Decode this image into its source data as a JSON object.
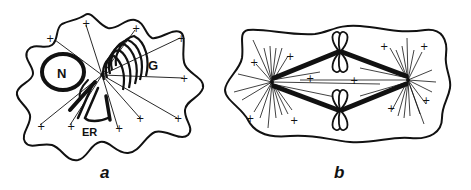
{
  "figure": {
    "panels": [
      {
        "id": "a",
        "caption": "a",
        "description": "Interphase cell with microtubules radiating from centrosome",
        "labels": {
          "nucleus": "N",
          "golgi": "G",
          "er": "ER"
        },
        "plus_end_marker": "+"
      },
      {
        "id": "b",
        "caption": "b",
        "description": "Mitotic spindle with two asters and chromosomes",
        "plus_end_marker": "+"
      }
    ]
  },
  "colors": {
    "ink": "#111111",
    "background": "#ffffff"
  }
}
